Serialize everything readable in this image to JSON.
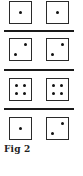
{
  "figure": {
    "caption": "Fig 2",
    "rows": [
      {
        "left": {
          "face": 1
        },
        "right": {
          "face": 1
        }
      },
      {
        "left": {
          "face": 2
        },
        "right": {
          "face": 2
        }
      },
      {
        "left": {
          "face": 4
        },
        "right": {
          "face": 4
        }
      },
      {
        "left": {
          "face": 1
        },
        "right": {
          "face": 2
        }
      }
    ],
    "colors": {
      "line": "#1a1a1a",
      "pip": "#111111",
      "border": "#2a2a2a"
    }
  }
}
